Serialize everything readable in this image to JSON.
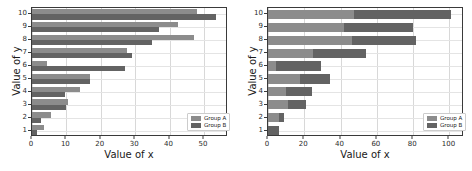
{
  "figure": {
    "panels": [
      {
        "id": "left-panel",
        "name": "grouped-bar-chart",
        "xlabel": "Value of x",
        "ylabel": "Value of y",
        "xticks": [
          "0",
          "10",
          "20",
          "30",
          "40",
          "50"
        ],
        "yticks": [
          "1",
          "2",
          "3",
          "4",
          "5",
          "6",
          "7",
          "8",
          "9",
          "10"
        ],
        "legend": [
          {
            "label": "Group A",
            "color": "#8c8c8c"
          },
          {
            "label": "Group B",
            "color": "#636363"
          }
        ]
      },
      {
        "id": "right-panel",
        "name": "stacked-bar-chart",
        "xlabel": "Value of x",
        "ylabel": "Value of y",
        "xticks": [
          "0",
          "20",
          "40",
          "60",
          "80",
          "100"
        ],
        "yticks": [
          "1",
          "2",
          "3",
          "4",
          "5",
          "6",
          "7",
          "8",
          "9",
          "10"
        ],
        "legend": [
          {
            "label": "Group A",
            "color": "#8c8c8c"
          },
          {
            "label": "Group B",
            "color": "#636363"
          }
        ]
      }
    ]
  },
  "chart_data": [
    {
      "type": "bar",
      "orientation": "horizontal",
      "mode": "grouped",
      "title": "",
      "xlabel": "Value of x",
      "ylabel": "Value of y",
      "xlim": [
        0,
        57
      ],
      "ylim": [
        0.5,
        10.5
      ],
      "xticks": [
        0,
        10,
        20,
        30,
        40,
        50
      ],
      "grid": true,
      "legend_position": "lower right",
      "categories": [
        1,
        2,
        3,
        4,
        5,
        6,
        7,
        8,
        9,
        10
      ],
      "series": [
        {
          "name": "Group A",
          "color": "#8c8c8c",
          "values": [
            3.5,
            5.5,
            10.5,
            14,
            17,
            4.5,
            27.5,
            47,
            42.5,
            48
          ]
        },
        {
          "name": "Group B",
          "color": "#636363",
          "values": [
            1.5,
            2.5,
            10,
            9.5,
            17,
            27,
            29,
            35,
            37,
            53.5
          ]
        }
      ]
    },
    {
      "type": "bar",
      "orientation": "horizontal",
      "mode": "stacked",
      "title": "",
      "xlabel": "Value of x",
      "ylabel": "Value of y",
      "xlim": [
        0,
        108
      ],
      "ylim": [
        0.5,
        10.5
      ],
      "xticks": [
        0,
        20,
        40,
        60,
        80,
        100
      ],
      "grid": true,
      "legend_position": "lower right",
      "categories": [
        1,
        2,
        3,
        4,
        5,
        6,
        7,
        8,
        9,
        10
      ],
      "series": [
        {
          "name": "Group A",
          "color": "#8c8c8c",
          "values": [
            0,
            6,
            11,
            10,
            17.5,
            4.5,
            25,
            46.5,
            42,
            47.5
          ]
        },
        {
          "name": "Group B",
          "color": "#636363",
          "values": [
            6,
            3,
            10,
            14,
            16.5,
            24.5,
            29,
            35,
            38,
            53.5
          ]
        }
      ]
    }
  ]
}
